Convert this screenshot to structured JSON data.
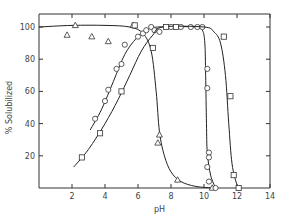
{
  "chart_data": {
    "type": "scatter",
    "title": "",
    "xlabel": "pH",
    "ylabel": "% Solubilized",
    "xlim": [
      0,
      14
    ],
    "ylim": [
      0,
      100
    ],
    "x_ticks": [
      2,
      4,
      6,
      8,
      10,
      12,
      14
    ],
    "y_ticks": [
      20,
      40,
      60,
      80,
      100
    ],
    "grid": false,
    "legend": "none",
    "series": [
      {
        "name": "triangles",
        "marker": "triangle",
        "points": [
          [
            1.7,
            95
          ],
          [
            2.2,
            101
          ],
          [
            3.2,
            94
          ],
          [
            4.2,
            91
          ],
          [
            5.7,
            101
          ],
          [
            7.3,
            33
          ],
          [
            7.2,
            28
          ],
          [
            8.4,
            5
          ],
          [
            10.5,
            0
          ]
        ],
        "curve": [
          [
            0,
            100
          ],
          [
            2,
            101
          ],
          [
            4,
            101
          ],
          [
            5.5,
            100
          ],
          [
            6.3,
            96
          ],
          [
            6.8,
            85
          ],
          [
            7.1,
            60
          ],
          [
            7.3,
            35
          ],
          [
            7.6,
            20
          ],
          [
            8,
            10
          ],
          [
            8.6,
            4
          ],
          [
            9.5,
            1
          ],
          [
            10.6,
            0
          ]
        ]
      },
      {
        "name": "circles",
        "marker": "circle",
        "points": [
          [
            3.4,
            43
          ],
          [
            4.0,
            54
          ],
          [
            4.2,
            61
          ],
          [
            4.7,
            74
          ],
          [
            5.0,
            77
          ],
          [
            5.2,
            89
          ],
          [
            6.0,
            94
          ],
          [
            6.3,
            96
          ],
          [
            6.5,
            98
          ],
          [
            6.8,
            100
          ],
          [
            7.0,
            98
          ],
          [
            7.3,
            97
          ],
          [
            8.0,
            100
          ],
          [
            8.6,
            100
          ],
          [
            9.2,
            100
          ],
          [
            9.6,
            100
          ],
          [
            9.9,
            100
          ],
          [
            10.2,
            74
          ],
          [
            10.2,
            62
          ],
          [
            10.3,
            22
          ],
          [
            10.3,
            19
          ],
          [
            10.2,
            13
          ],
          [
            10.3,
            4
          ],
          [
            10.7,
            0
          ]
        ],
        "curve": [
          [
            3.1,
            36
          ],
          [
            3.8,
            49
          ],
          [
            4.5,
            66
          ],
          [
            5.2,
            83
          ],
          [
            5.9,
            93
          ],
          [
            6.5,
            98
          ],
          [
            7.2,
            100
          ],
          [
            9.5,
            100
          ],
          [
            9.9,
            98
          ],
          [
            10.05,
            90
          ],
          [
            10.1,
            70
          ],
          [
            10.15,
            40
          ],
          [
            10.2,
            22
          ],
          [
            10.4,
            8
          ],
          [
            10.7,
            0
          ]
        ]
      },
      {
        "name": "squares",
        "marker": "square",
        "points": [
          [
            2.6,
            19
          ],
          [
            3.7,
            34
          ],
          [
            5.0,
            60
          ],
          [
            5.8,
            101
          ],
          [
            6.9,
            87
          ],
          [
            7.7,
            100
          ],
          [
            8.3,
            100
          ],
          [
            11.2,
            94
          ],
          [
            11.6,
            57
          ],
          [
            11.8,
            8
          ],
          [
            12.1,
            0
          ]
        ],
        "curve": [
          [
            2.1,
            13
          ],
          [
            3.0,
            24
          ],
          [
            4.0,
            40
          ],
          [
            4.8,
            55
          ],
          [
            5.5,
            70
          ],
          [
            6.2,
            85
          ],
          [
            6.9,
            95
          ],
          [
            7.5,
            100
          ],
          [
            10.0,
            100
          ],
          [
            10.6,
            97
          ],
          [
            11.0,
            90
          ],
          [
            11.3,
            70
          ],
          [
            11.5,
            40
          ],
          [
            11.7,
            15
          ],
          [
            12.0,
            2
          ],
          [
            12.2,
            0
          ]
        ]
      }
    ]
  },
  "labels": {
    "xlabel": "pH",
    "ylabel": "% Solubilized",
    "x_ticks": [
      "2",
      "4",
      "6",
      "8",
      "10",
      "12",
      "14"
    ],
    "y_ticks": [
      "20",
      "40",
      "60",
      "80",
      "100"
    ]
  }
}
